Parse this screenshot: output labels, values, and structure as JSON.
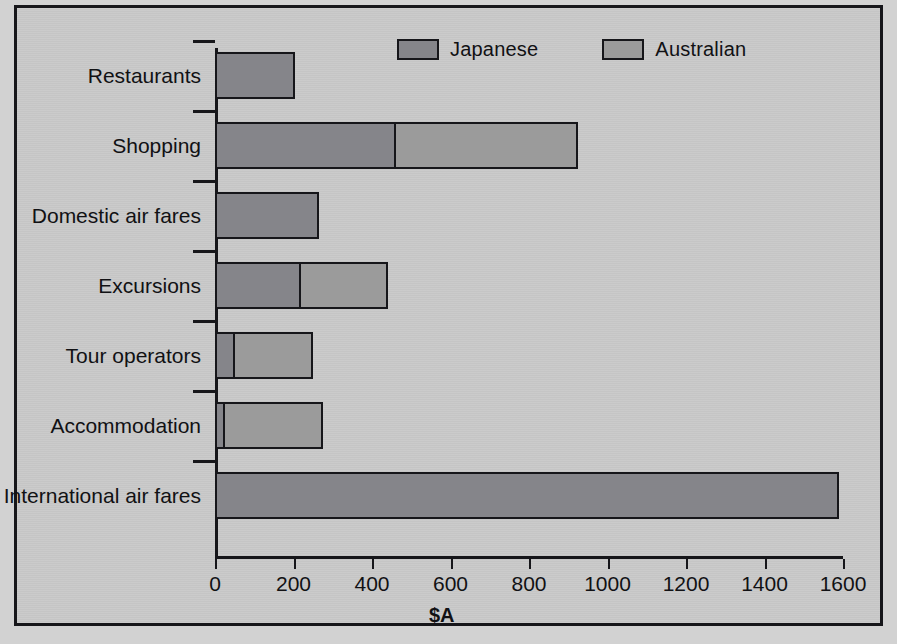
{
  "figure": {
    "x_axis_title": "$A",
    "background_color": "#c9c9c9",
    "border_color": "#16161a"
  },
  "legend": {
    "position": "top-center",
    "entries": [
      {
        "label": "Japanese",
        "color": "#85858a"
      },
      {
        "label": "Australian",
        "color": "#9b9b9b"
      }
    ]
  },
  "chart_data": {
    "type": "bar",
    "orientation": "horizontal",
    "stacked": true,
    "title": "",
    "subtitle": "",
    "xlabel": "$A",
    "ylabel": "",
    "xlim": [
      0,
      1600
    ],
    "xticks": [
      0,
      200,
      400,
      600,
      800,
      1000,
      1200,
      1400,
      1600
    ],
    "xtick_labels": [
      "0",
      "200",
      "400",
      "600",
      "800",
      "1000",
      "1200",
      "1400",
      "1600"
    ],
    "grid": false,
    "legend_position": "top-center",
    "categories": [
      "Restaurants",
      "Shopping",
      "Domestic air fares",
      "Excursions",
      "Tour operators",
      "Accommodation",
      "International air fares"
    ],
    "series": [
      {
        "name": "Japanese",
        "color": "#85858a",
        "values": [
          205,
          460,
          265,
          220,
          50,
          25,
          1590
        ]
      },
      {
        "name": "Australian",
        "color": "#9b9b9b",
        "values": [
          0,
          470,
          0,
          225,
          205,
          255,
          0
        ]
      }
    ],
    "totals": [
      205,
      930,
      265,
      445,
      255,
      280,
      1590
    ]
  }
}
